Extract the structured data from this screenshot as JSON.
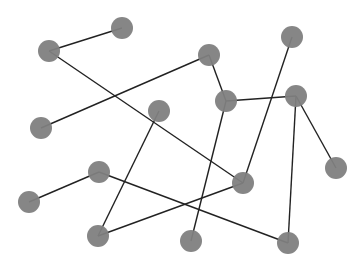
{
  "diagram": {
    "type": "network-graph",
    "node_radius": 11,
    "node_color": "#808080",
    "edge_color": "#222222",
    "nodes": [
      {
        "id": "n1",
        "x": 49,
        "y": 51
      },
      {
        "id": "n2",
        "x": 122,
        "y": 28
      },
      {
        "id": "n3",
        "x": 209,
        "y": 55
      },
      {
        "id": "n4",
        "x": 292,
        "y": 37
      },
      {
        "id": "n5",
        "x": 226,
        "y": 101
      },
      {
        "id": "n6",
        "x": 296,
        "y": 96
      },
      {
        "id": "n7",
        "x": 41,
        "y": 128
      },
      {
        "id": "n8",
        "x": 159,
        "y": 111
      },
      {
        "id": "n9",
        "x": 336,
        "y": 168
      },
      {
        "id": "n10",
        "x": 99,
        "y": 172
      },
      {
        "id": "n11",
        "x": 243,
        "y": 183
      },
      {
        "id": "n12",
        "x": 29,
        "y": 202
      },
      {
        "id": "n13",
        "x": 98,
        "y": 236
      },
      {
        "id": "n14",
        "x": 191,
        "y": 241
      },
      {
        "id": "n15",
        "x": 288,
        "y": 243
      }
    ],
    "edges": [
      [
        "n1",
        "n2"
      ],
      [
        "n1",
        "n11"
      ],
      [
        "n7",
        "n3"
      ],
      [
        "n3",
        "n5"
      ],
      [
        "n5",
        "n6"
      ],
      [
        "n5",
        "n14"
      ],
      [
        "n4",
        "n11"
      ],
      [
        "n6",
        "n9"
      ],
      [
        "n6",
        "n15"
      ],
      [
        "n8",
        "n13"
      ],
      [
        "n12",
        "n10"
      ],
      [
        "n10",
        "n15"
      ],
      [
        "n13",
        "n11"
      ]
    ]
  }
}
